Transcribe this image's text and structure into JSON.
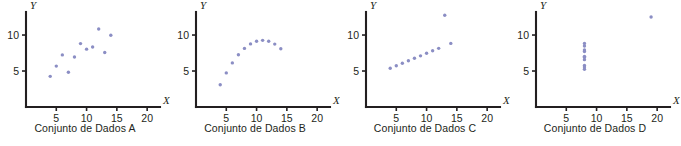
{
  "figure": {
    "name": "anscombe-quartet",
    "point_color": "#8b8ec4",
    "axis_color": "#231f20",
    "text_color": "#231f20"
  },
  "chart_data": [
    {
      "type": "scatter",
      "title": "Conjunto de Dados A",
      "xlabel": "X",
      "ylabel": "Y",
      "xlim": [
        0,
        20.8
      ],
      "ylim": [
        0,
        13.2
      ],
      "xticks": [
        5,
        10,
        15,
        20
      ],
      "yticks": [
        5,
        10
      ],
      "xticklabels": [
        "5",
        "10",
        "15",
        "20"
      ],
      "yticklabels": [
        "5",
        "10"
      ],
      "grid": false,
      "legend": "none",
      "x": [
        10.0,
        8.0,
        13.0,
        9.0,
        11.0,
        14.0,
        6.0,
        4.0,
        12.0,
        7.0,
        5.0
      ],
      "y": [
        8.04,
        6.95,
        7.58,
        8.81,
        8.33,
        9.96,
        7.24,
        4.26,
        10.84,
        4.82,
        5.68
      ]
    },
    {
      "type": "scatter",
      "title": "Conjunto de Dados B",
      "xlabel": "X",
      "ylabel": "Y",
      "xlim": [
        0,
        20.8
      ],
      "ylim": [
        0,
        13.2
      ],
      "xticks": [
        5,
        10,
        15,
        20
      ],
      "yticks": [
        5,
        10
      ],
      "xticklabels": [
        "5",
        "10",
        "15",
        "20"
      ],
      "yticklabels": [
        "5",
        "10"
      ],
      "grid": false,
      "legend": "none",
      "x": [
        10.0,
        8.0,
        13.0,
        9.0,
        11.0,
        14.0,
        6.0,
        4.0,
        12.0,
        7.0,
        5.0
      ],
      "y": [
        9.14,
        8.14,
        8.74,
        8.77,
        9.26,
        8.1,
        6.13,
        3.1,
        9.13,
        7.26,
        4.74
      ]
    },
    {
      "type": "scatter",
      "title": "Conjunto de Dados C",
      "xlabel": "X",
      "ylabel": "Y",
      "xlim": [
        0,
        20.8
      ],
      "ylim": [
        0,
        13.2
      ],
      "xticks": [
        5,
        10,
        15,
        20
      ],
      "yticks": [
        5,
        10
      ],
      "xticklabels": [
        "5",
        "10",
        "15",
        "20"
      ],
      "yticklabels": [
        "5",
        "10"
      ],
      "grid": false,
      "legend": "none",
      "x": [
        10.0,
        8.0,
        13.0,
        9.0,
        11.0,
        14.0,
        6.0,
        4.0,
        12.0,
        7.0,
        5.0
      ],
      "y": [
        7.46,
        6.77,
        12.74,
        7.11,
        7.81,
        8.84,
        6.08,
        5.39,
        8.15,
        6.42,
        5.73
      ]
    },
    {
      "type": "scatter",
      "title": "Conjunto de Dados D",
      "xlabel": "X",
      "ylabel": "Y",
      "xlim": [
        0,
        20.8
      ],
      "ylim": [
        0,
        13.2
      ],
      "xticks": [
        5,
        10,
        15,
        20
      ],
      "yticks": [
        5,
        10
      ],
      "xticklabels": [
        "5",
        "10",
        "15",
        "20"
      ],
      "yticklabels": [
        "5",
        "10"
      ],
      "grid": false,
      "legend": "none",
      "x": [
        8.0,
        8.0,
        8.0,
        8.0,
        8.0,
        8.0,
        8.0,
        19.0,
        8.0,
        8.0,
        8.0
      ],
      "y": [
        6.58,
        5.76,
        7.71,
        8.84,
        8.47,
        7.04,
        5.25,
        12.5,
        5.56,
        7.91,
        6.89
      ]
    }
  ]
}
